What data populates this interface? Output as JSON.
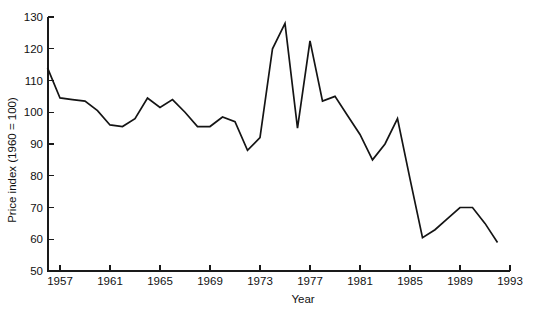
{
  "chart_data": {
    "type": "line",
    "title": "",
    "xlabel": "Year",
    "ylabel": "Price index (1960 = 100)",
    "xlim": [
      1956,
      1993
    ],
    "ylim": [
      50,
      130
    ],
    "grid": false,
    "legend": "none",
    "line_color": "#141414",
    "x_ticks": [
      1957,
      1961,
      1965,
      1969,
      1973,
      1977,
      1981,
      1985,
      1989,
      1993
    ],
    "x_tick_labels": [
      "1957",
      "1961",
      "1965",
      "1969",
      "1973",
      "1977",
      "1981",
      "1985",
      "1989",
      "1993"
    ],
    "y_ticks": [
      50,
      60,
      70,
      80,
      90,
      100,
      110,
      120,
      130
    ],
    "y_tick_labels": [
      "50",
      "60",
      "70",
      "80",
      "90",
      "100",
      "110",
      "120",
      "130"
    ],
    "series": [
      {
        "name": "Price index",
        "x": [
          1956,
          1957,
          1958,
          1959,
          1960,
          1961,
          1962,
          1963,
          1964,
          1965,
          1966,
          1967,
          1968,
          1969,
          1970,
          1971,
          1972,
          1973,
          1974,
          1975,
          1976,
          1977,
          1978,
          1979,
          1980,
          1981,
          1982,
          1983,
          1984,
          1985,
          1986,
          1987,
          1988,
          1989,
          1990,
          1991,
          1992
        ],
        "values": [
          114,
          104.5,
          104,
          103.5,
          100.5,
          96,
          95.5,
          98,
          104.5,
          101.5,
          104,
          100,
          95.5,
          95.5,
          98.5,
          97,
          88,
          92,
          120,
          128,
          95,
          122.5,
          103.5,
          105,
          99,
          93,
          85,
          90,
          98,
          79,
          60.5,
          63,
          66.5,
          70,
          70,
          65,
          59
        ]
      }
    ],
    "annotations": []
  },
  "figure": {
    "background_color": "#ffffff",
    "axis_color": "#1a1a1a"
  }
}
